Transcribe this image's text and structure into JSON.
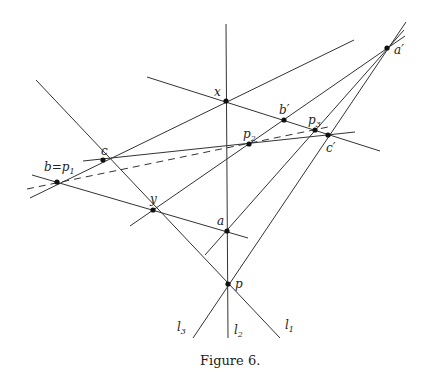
{
  "figure": {
    "caption": "Figure 6.",
    "labels": {
      "x": "x",
      "b_prime": "b′",
      "p3_base": "p",
      "p3_sub": "3",
      "a_prime": "a′",
      "c": "c",
      "p2_base": "p",
      "p2_sub": "2",
      "c_prime": "c′",
      "b_p1_base": "b=p",
      "b_p1_sub": "1",
      "y": "y",
      "a": "a",
      "p": "p",
      "l1_base": "l",
      "l1_sub": "1",
      "l2_base": "l",
      "l2_sub": "2",
      "l3_base": "l",
      "l3_sub": "3"
    }
  }
}
